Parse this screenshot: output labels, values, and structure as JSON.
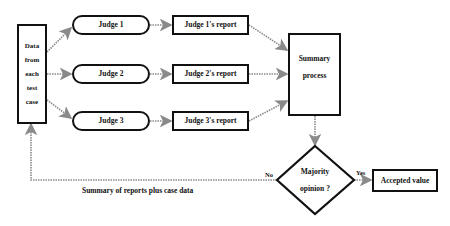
{
  "diagram": {
    "data_node": {
      "lines": [
        "Data",
        "from",
        "each",
        "test",
        "case"
      ]
    },
    "judges": [
      {
        "label": "Judge 1",
        "report": "Judge 1's report"
      },
      {
        "label": "Judge 2",
        "report": "Judge 2's report"
      },
      {
        "label": "Judge 3",
        "report": "Judge 3's report"
      }
    ],
    "summary_node": {
      "lines": [
        "Summary",
        "process"
      ]
    },
    "decision_node": {
      "lines": [
        "Majority",
        "opinion ?"
      ]
    },
    "accepted_node": {
      "label": "Accepted value"
    },
    "edge_labels": {
      "yes": "Yes",
      "no": "No",
      "feedback": "Summary of reports plus case data"
    },
    "colors": {
      "stroke": "#111111",
      "arrow": "#8a8a8a"
    }
  }
}
